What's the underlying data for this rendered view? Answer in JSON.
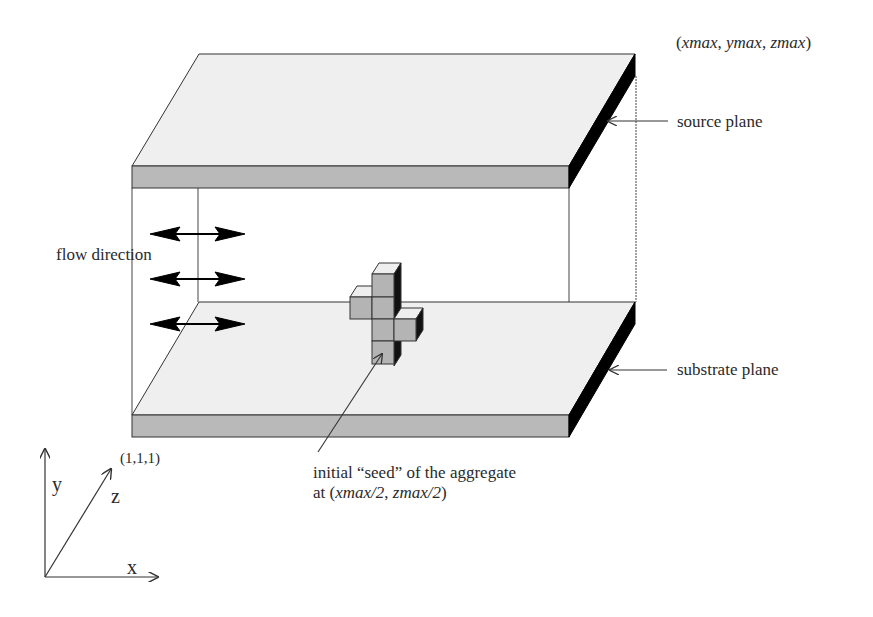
{
  "diagram": {
    "labels": {
      "corner_max": {
        "prefix": "(",
        "x": "xmax",
        "sep1": ", ",
        "y": "ymax",
        "sep2": ", ",
        "z": "zmax",
        "suffix": ")"
      },
      "source_plane": "source plane",
      "substrate_plane": "substrate plane",
      "flow_direction": "flow direction",
      "seed_line1": "initial “seed” of the aggregate",
      "seed_line2_prefix": "at (",
      "seed_line2_x": "xmax/2",
      "seed_line2_sep": ", ",
      "seed_line2_z": "zmax/2",
      "seed_line2_suffix": ")",
      "corner_min": "(1,1,1)"
    },
    "axes": {
      "x": "x",
      "y": "y",
      "z": "z"
    },
    "colors": {
      "plane_top": "#efefef",
      "plane_front": "#b9b9b9",
      "plane_side": "#000000",
      "cube_front": "#b4b4b4",
      "cube_top": "#eeeeee",
      "cube_side": "#111111",
      "line": "#333333"
    },
    "flow_arrows_count": 3,
    "seed_cubes": [
      {
        "col": 0,
        "row": 0
      },
      {
        "col": 0,
        "row": 1
      },
      {
        "col": 0,
        "row": 2
      },
      {
        "col": 0,
        "row": 3
      },
      {
        "col": -1,
        "row": 1
      },
      {
        "col": 1,
        "row": 2
      }
    ]
  }
}
